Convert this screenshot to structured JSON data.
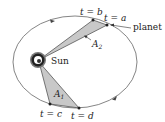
{
  "diagram": {
    "labels": {
      "t_b": "t = b",
      "t_a": "t = a",
      "planet": "planet",
      "area2_letter": "A",
      "area2_sub": "2",
      "sun": "Sun",
      "area1_letter": "A",
      "area1_sub": "1",
      "t_c": "t = c",
      "t_d": "t = d"
    },
    "colors": {
      "orbit": "#555555",
      "shade": "#c8c8c8",
      "ink": "#222222"
    }
  }
}
